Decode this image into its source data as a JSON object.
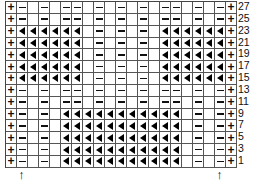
{
  "chart": {
    "columns": 21,
    "legend": {
      "+": "knit",
      "-": "purl",
      "<": "slip/decrease triangle",
      ".": "blank"
    },
    "rows": [
      {
        "label": "27",
        "cells": "+-.-.--.-.-.-.--.-.-+"
      },
      {
        "label": "25",
        "cells": "+-.-.--.-.-.-.--.-.-+"
      },
      {
        "label": "23",
        "cells": "+<<<<<<.-.-.-.<<<<<<+"
      },
      {
        "label": "21",
        "cells": "+<<<<<<.-.-.-.<<<<<<+"
      },
      {
        "label": "19",
        "cells": "+<<<<<<.-.-.-.<<<<<<+"
      },
      {
        "label": "17",
        "cells": "+<<<<<<.-.-.-.<<<<<<+"
      },
      {
        "label": "15",
        "cells": "+<<<<<<.-.-.-.<<<<<<+"
      },
      {
        "label": "13",
        "cells": "+-.-.--.-.-.-.--.-.-+"
      },
      {
        "label": "11",
        "cells": "+-.-.--.-.-.-.--.-.-+"
      },
      {
        "label": "9",
        "cells": "+-.-.<<<<<<<<<<<.-.-+"
      },
      {
        "label": "7",
        "cells": "+-.-.<<<<<<<<<<<.-.-+"
      },
      {
        "label": "5",
        "cells": "+-.-.<<<<<<<<<<<.-.-+"
      },
      {
        "label": "3",
        "cells": "+-.-.<<<<<<<<<<<.-.-+"
      },
      {
        "label": "1",
        "cells": "+-.-.<<<<<<<<<<<.-.-+"
      }
    ],
    "arrows": [
      {
        "symbol": "↑",
        "column": 2
      },
      {
        "symbol": "↑",
        "column": 20
      }
    ]
  }
}
